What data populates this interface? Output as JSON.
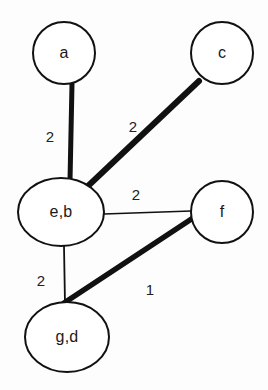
{
  "figure": {
    "type": "node-link-diagram",
    "width": 268,
    "height": 390,
    "background_color": "#fdfdfd",
    "stroke_color": "#111111",
    "label_color": "#1a1a1a"
  },
  "nodes": [
    {
      "id": "a",
      "label": "a",
      "shape": "circle",
      "cx": 64,
      "cy": 53,
      "rx": 31,
      "ry": 31,
      "stroke_width": 2,
      "fill": "#ffffff"
    },
    {
      "id": "c",
      "label": "c",
      "shape": "circle",
      "cx": 222,
      "cy": 53,
      "rx": 31,
      "ry": 31,
      "stroke_width": 2,
      "fill": "#ffffff"
    },
    {
      "id": "eb",
      "label": "e,b",
      "shape": "ellipse",
      "cx": 61,
      "cy": 212,
      "rx": 43,
      "ry": 34,
      "stroke_width": 2,
      "fill": "#ffffff"
    },
    {
      "id": "f",
      "label": "f",
      "shape": "circle",
      "cx": 222,
      "cy": 212,
      "rx": 31,
      "ry": 31,
      "stroke_width": 2,
      "fill": "#ffffff"
    },
    {
      "id": "gd",
      "label": "g,d",
      "shape": "ellipse",
      "cx": 67,
      "cy": 337,
      "rx": 42,
      "ry": 35,
      "stroke_width": 2,
      "fill": "#ffffff"
    }
  ],
  "edges": [
    {
      "id": "a-eb",
      "source": "a",
      "target": "eb",
      "weight": "2",
      "style": "thick",
      "stroke_width": 5,
      "x1": 72,
      "y1": 84,
      "x2": 70,
      "y2": 181,
      "label_x": 50,
      "label_y": 136
    },
    {
      "id": "eb-c",
      "source": "eb",
      "target": "c",
      "weight": "2",
      "style": "thick",
      "stroke_width": 6,
      "x1": 88,
      "y1": 186,
      "x2": 199,
      "y2": 81,
      "label_x": 133,
      "label_y": 126
    },
    {
      "id": "eb-f",
      "source": "eb",
      "target": "f",
      "weight": "2",
      "style": "thin",
      "stroke_width": 1.6,
      "x1": 104,
      "y1": 214,
      "x2": 191,
      "y2": 211,
      "label_x": 136,
      "label_y": 194
    },
    {
      "id": "eb-gd",
      "source": "eb",
      "target": "gd",
      "weight": "2",
      "style": "thin",
      "stroke_width": 1.8,
      "x1": 64,
      "y1": 246,
      "x2": 65,
      "y2": 304,
      "label_x": 41,
      "label_y": 280
    },
    {
      "id": "f-gd",
      "source": "f",
      "target": "gd",
      "weight": "1",
      "style": "thick",
      "stroke_width": 5.5,
      "x1": 196,
      "y1": 216,
      "x2": 64,
      "y2": 303,
      "label_x": 150,
      "label_y": 289
    }
  ]
}
